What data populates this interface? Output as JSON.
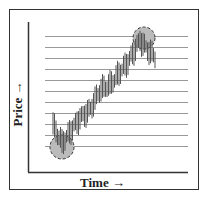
{
  "diagram": {
    "y_axis_label": "Price →",
    "x_axis_label": "Time →",
    "gridline_count": 11,
    "highlights": [
      {
        "name": "low-point",
        "description": "circled bottom of trend"
      },
      {
        "name": "high-point",
        "description": "circled top of trend"
      }
    ],
    "colors": {
      "bars": "#555555",
      "circle_fill": "#bbbbbb",
      "gridline": "#999999",
      "axis": "#333333"
    }
  }
}
